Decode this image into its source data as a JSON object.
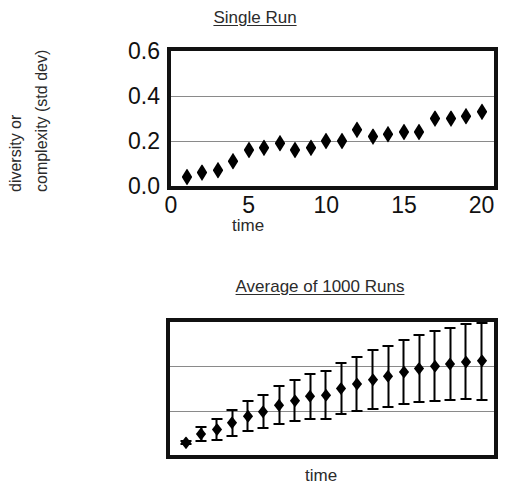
{
  "chart_data": [
    {
      "type": "scatter",
      "title": "Single Run",
      "xlabel": "time",
      "ylabel_line1": "diversity or",
      "ylabel_line2": "complexity (std dev)",
      "ylabel": "diversity or complexity (std dev)",
      "xlim": [
        0,
        20.8
      ],
      "ylim": [
        0.0,
        0.6
      ],
      "yticks": [
        "0.0",
        "0.2",
        "0.4",
        "0.6"
      ],
      "ytick_values": [
        0.0,
        0.2,
        0.4,
        0.6
      ],
      "xticks": [
        "0",
        "5",
        "10",
        "15",
        "20"
      ],
      "xtick_values": [
        0,
        5,
        10,
        15,
        20
      ],
      "gridlines_y": [
        0.2,
        0.4
      ],
      "grid": true,
      "legend": "none",
      "marker": "diamond",
      "marker_color": "#000000",
      "x": [
        1,
        2,
        3,
        4,
        5,
        6,
        7,
        8,
        9,
        10,
        11,
        12,
        13,
        14,
        15,
        16,
        17,
        18,
        19,
        20
      ],
      "values": [
        0.04,
        0.06,
        0.07,
        0.11,
        0.16,
        0.17,
        0.19,
        0.16,
        0.17,
        0.2,
        0.2,
        0.25,
        0.22,
        0.23,
        0.24,
        0.24,
        0.3,
        0.3,
        0.31,
        0.33
      ]
    },
    {
      "type": "scatter",
      "title": "Average of 1000 Runs",
      "xlabel": "time",
      "ylabel": "",
      "xlim": [
        0,
        20.8
      ],
      "ylim": [
        0.0,
        0.6
      ],
      "yticks": [],
      "xticks": [],
      "gridlines_y": [
        0.2,
        0.4
      ],
      "grid": true,
      "legend": "none",
      "marker": "diamond",
      "marker_color": "#000000",
      "errorbars": true,
      "x": [
        1,
        2,
        3,
        4,
        5,
        6,
        7,
        8,
        9,
        10,
        11,
        12,
        13,
        14,
        15,
        16,
        17,
        18,
        19,
        20
      ],
      "values": [
        0.055,
        0.095,
        0.115,
        0.145,
        0.175,
        0.195,
        0.225,
        0.245,
        0.265,
        0.27,
        0.3,
        0.32,
        0.34,
        0.355,
        0.375,
        0.39,
        0.4,
        0.41,
        0.42,
        0.425
      ],
      "errors": [
        0.012,
        0.038,
        0.052,
        0.062,
        0.072,
        0.08,
        0.09,
        0.098,
        0.105,
        0.112,
        0.12,
        0.128,
        0.136,
        0.142,
        0.15,
        0.156,
        0.162,
        0.168,
        0.174,
        0.18
      ]
    }
  ]
}
